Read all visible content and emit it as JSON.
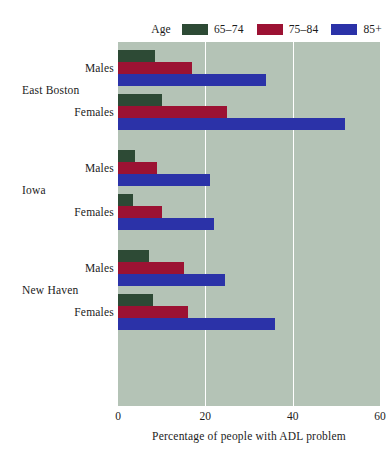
{
  "legend": {
    "title": "Age",
    "items": [
      {
        "label": "65–74",
        "color": "#2d4a35",
        "name": "legend-65-74"
      },
      {
        "label": "75–84",
        "color": "#9c1233",
        "name": "legend-75-84"
      },
      {
        "label": "85+",
        "color": "#2b32a8",
        "name": "legend-85plus"
      }
    ]
  },
  "axis": {
    "x_title": "Percentage of people with ADL problem",
    "x_ticks": [
      "0",
      "20",
      "40",
      "60"
    ],
    "x_tick_values": [
      0,
      20,
      40,
      60
    ],
    "xlim": [
      0,
      60
    ]
  },
  "groups": [
    {
      "label": "East Boston",
      "sub": [
        "Males",
        "Females"
      ]
    },
    {
      "label": "Iowa",
      "sub": [
        "Males",
        "Females"
      ]
    },
    {
      "label": "New Haven",
      "sub": [
        "Males",
        "Females"
      ]
    }
  ],
  "chart_data": {
    "type": "bar",
    "orientation": "horizontal",
    "title": "",
    "xlabel": "Percentage of people with ADL problem",
    "ylabel": "",
    "xlim": [
      0,
      60
    ],
    "xticks": [
      0,
      20,
      40,
      60
    ],
    "grid": true,
    "grid_axis": "x",
    "legend_title": "Age",
    "legend_position": "top-right",
    "plot_background": "#b4c3b6",
    "page_background": "#ffffff",
    "categories": [
      "East Boston / Males",
      "East Boston / Females",
      "Iowa / Males",
      "Iowa / Females",
      "New Haven / Males",
      "New Haven / Females"
    ],
    "series": [
      {
        "name": "65–74",
        "color": "#2d4a35",
        "values": [
          8.5,
          10.0,
          4.0,
          3.5,
          7.0,
          8.0
        ]
      },
      {
        "name": "75–84",
        "color": "#9c1233",
        "values": [
          17.0,
          25.0,
          9.0,
          10.0,
          15.0,
          16.0
        ]
      },
      {
        "name": "85+",
        "color": "#2b32a8",
        "values": [
          34.0,
          52.0,
          21.0,
          22.0,
          24.5,
          36.0
        ]
      }
    ]
  }
}
